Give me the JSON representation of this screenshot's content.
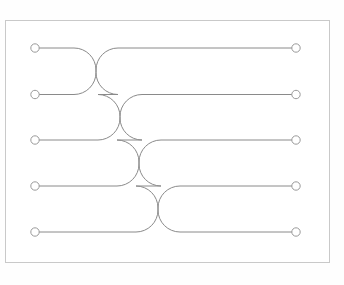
{
  "canvas": {
    "width": 344,
    "height": 285,
    "background_color": "#fefefe"
  },
  "frame": {
    "label": "diagram-border",
    "x": 5.5,
    "y": 20.5,
    "width": 324,
    "height": 242,
    "stroke_color": "#c9c9c9",
    "fill_color": "#ffffff",
    "stroke_width": 1
  },
  "diagram": {
    "type": "wire-crossing-permutation",
    "wire_count": 5,
    "crossing_count": 4,
    "style": {
      "wire_stroke_color": "#8a8a8a",
      "wire_stroke_width": 1,
      "node_fill_color": "#ffffff",
      "node_stroke_color": "#9a9a9a",
      "node_radius": 4.2,
      "corner_radius": 22
    },
    "geometry": {
      "left_terminal_x": 35,
      "right_terminal_x": 296,
      "row_y": [
        48,
        94.5,
        140,
        186,
        232
      ],
      "crossing_center_x": [
        96,
        120,
        139,
        158
      ]
    },
    "rows": [
      {
        "index": 1,
        "y": 48,
        "left_label": "in-1",
        "right_label": "out-1"
      },
      {
        "index": 2,
        "y": 94.5,
        "left_label": "in-2",
        "right_label": "out-2"
      },
      {
        "index": 3,
        "y": 140,
        "left_label": "in-3",
        "right_label": "out-3"
      },
      {
        "index": 4,
        "y": 186,
        "left_label": "in-4",
        "right_label": "out-4"
      },
      {
        "index": 5,
        "y": 232,
        "left_label": "in-5",
        "right_label": "out-5"
      }
    ],
    "crossings": [
      {
        "index": 1,
        "center_x": 96,
        "upper_row": 1,
        "lower_row": 2,
        "upper_y": 48,
        "lower_y": 94.5
      },
      {
        "index": 2,
        "center_x": 120,
        "upper_row": 2,
        "lower_row": 3,
        "upper_y": 94.5,
        "lower_y": 140
      },
      {
        "index": 3,
        "center_x": 139,
        "upper_row": 3,
        "lower_row": 4,
        "upper_y": 140,
        "lower_y": 186
      },
      {
        "index": 4,
        "center_x": 158,
        "upper_row": 4,
        "lower_row": 5,
        "upper_y": 186,
        "lower_y": 232
      }
    ],
    "wires": [
      {
        "id": "wire-1",
        "start_row": 1,
        "end_row": 5,
        "description": "descends through all four crossings"
      },
      {
        "id": "wire-2",
        "start_row": 2,
        "end_row": 1,
        "description": "rises one row at crossing 1"
      },
      {
        "id": "wire-3",
        "start_row": 3,
        "end_row": 2,
        "description": "rises one row at crossing 2"
      },
      {
        "id": "wire-4",
        "start_row": 4,
        "end_row": 3,
        "description": "rises one row at crossing 3"
      },
      {
        "id": "wire-5",
        "start_row": 5,
        "end_row": 4,
        "description": "rises one row at crossing 4"
      }
    ]
  }
}
